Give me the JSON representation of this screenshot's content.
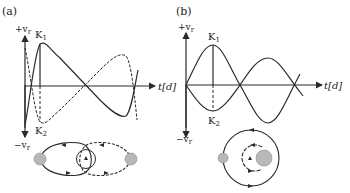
{
  "panels": [
    {
      "id": "a",
      "label": "(a)",
      "y_pos_label": "+v",
      "y_neg_label": "−v",
      "y_sub": "r",
      "x_label": "t[d]",
      "peak_label": "K",
      "peak_sub": "1",
      "trough_label": "K",
      "trough_sub": "2",
      "orbit": "eccentric",
      "star_color": "#b8b8b8"
    },
    {
      "id": "b",
      "label": "(b)",
      "y_pos_label": "+v",
      "y_neg_label": "−v",
      "y_sub": "r",
      "x_label": "t[d]",
      "peak_label": "K",
      "peak_sub": "1",
      "trough_label": "K",
      "trough_sub": "2",
      "orbit": "circular",
      "star_color": "#b8b8b8"
    }
  ],
  "colors": {
    "line": "#2a2a2a",
    "star": "#b8b8b8"
  }
}
